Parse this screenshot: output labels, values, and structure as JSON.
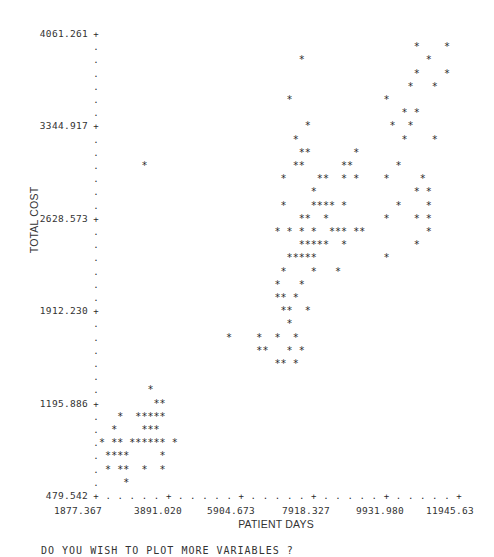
{
  "chart_data": {
    "type": "scatter",
    "style": "line-printer character plot",
    "title": "",
    "xlabel": "PATIENT DAYS",
    "ylabel": "TOTAL COST",
    "xlim": [
      1877.367,
      11945.63
    ],
    "ylim": [
      479.542,
      4061.261
    ],
    "x_ticks": [
      "1877.367",
      "3891.020",
      "5904.673",
      "7918.327",
      "9931.980",
      "11945.63"
    ],
    "y_ticks": [
      "4061.261",
      "3344.917",
      "2628.573",
      "1912.230",
      "1195.886",
      "479.542"
    ],
    "grid": false,
    "marker": "*",
    "grid_cols": 61,
    "grid_rows": 36,
    "points_rowcol": [
      [
        2,
        34
      ],
      [
        5,
        32
      ],
      [
        7,
        35
      ],
      [
        8,
        33
      ],
      [
        9,
        34
      ],
      [
        9,
        35
      ],
      [
        9,
        43
      ],
      [
        10,
        8
      ],
      [
        10,
        33
      ],
      [
        10,
        34
      ],
      [
        10,
        41
      ],
      [
        10,
        42
      ],
      [
        11,
        31
      ],
      [
        11,
        37
      ],
      [
        11,
        38
      ],
      [
        11,
        41
      ],
      [
        11,
        43
      ],
      [
        12,
        36
      ],
      [
        13,
        31
      ],
      [
        13,
        36
      ],
      [
        13,
        37
      ],
      [
        13,
        38
      ],
      [
        13,
        39
      ],
      [
        13,
        41
      ],
      [
        14,
        34
      ],
      [
        14,
        35
      ],
      [
        14,
        38
      ],
      [
        15,
        30
      ],
      [
        15,
        32
      ],
      [
        15,
        34
      ],
      [
        15,
        36
      ],
      [
        15,
        39
      ],
      [
        15,
        40
      ],
      [
        15,
        41
      ],
      [
        15,
        43
      ],
      [
        15,
        44
      ],
      [
        16,
        34
      ],
      [
        16,
        35
      ],
      [
        16,
        36
      ],
      [
        16,
        37
      ],
      [
        16,
        38
      ],
      [
        16,
        41
      ],
      [
        17,
        32
      ],
      [
        17,
        33
      ],
      [
        17,
        34
      ],
      [
        17,
        35
      ],
      [
        17,
        36
      ],
      [
        18,
        31
      ],
      [
        18,
        36
      ],
      [
        18,
        40
      ],
      [
        19,
        30
      ],
      [
        19,
        34
      ],
      [
        20,
        30
      ],
      [
        20,
        31
      ],
      [
        20,
        33
      ],
      [
        21,
        31
      ],
      [
        21,
        32
      ],
      [
        21,
        35
      ],
      [
        22,
        32
      ],
      [
        23,
        22
      ],
      [
        23,
        27
      ],
      [
        23,
        30
      ],
      [
        23,
        33
      ],
      [
        24,
        27
      ],
      [
        24,
        28
      ],
      [
        24,
        32
      ],
      [
        24,
        34
      ],
      [
        25,
        30
      ],
      [
        25,
        31
      ],
      [
        25,
        33
      ],
      [
        1,
        53
      ],
      [
        1,
        58
      ],
      [
        2,
        55
      ],
      [
        3,
        53
      ],
      [
        3,
        58
      ],
      [
        4,
        52
      ],
      [
        4,
        56
      ],
      [
        5,
        48
      ],
      [
        6,
        51
      ],
      [
        6,
        53
      ],
      [
        7,
        49
      ],
      [
        7,
        52
      ],
      [
        8,
        51
      ],
      [
        8,
        56
      ],
      [
        10,
        50
      ],
      [
        11,
        48
      ],
      [
        11,
        54
      ],
      [
        12,
        53
      ],
      [
        12,
        55
      ],
      [
        13,
        50
      ],
      [
        13,
        55
      ],
      [
        14,
        48
      ],
      [
        14,
        53
      ],
      [
        14,
        55
      ],
      [
        15,
        55
      ],
      [
        16,
        53
      ],
      [
        17,
        48
      ],
      [
        27,
        9
      ],
      [
        28,
        10
      ],
      [
        28,
        11
      ],
      [
        29,
        4
      ],
      [
        29,
        7
      ],
      [
        29,
        8
      ],
      [
        29,
        9
      ],
      [
        29,
        10
      ],
      [
        29,
        11
      ],
      [
        30,
        3
      ],
      [
        30,
        8
      ],
      [
        30,
        9
      ],
      [
        30,
        10
      ],
      [
        31,
        1
      ],
      [
        31,
        3
      ],
      [
        31,
        4
      ],
      [
        31,
        6
      ],
      [
        31,
        7
      ],
      [
        31,
        8
      ],
      [
        31,
        9
      ],
      [
        31,
        10
      ],
      [
        31,
        11
      ],
      [
        31,
        13
      ],
      [
        32,
        2
      ],
      [
        32,
        3
      ],
      [
        32,
        4
      ],
      [
        32,
        5
      ],
      [
        32,
        11
      ],
      [
        33,
        2
      ],
      [
        33,
        4
      ],
      [
        33,
        5
      ],
      [
        33,
        8
      ],
      [
        33,
        11
      ],
      [
        34,
        5
      ]
    ]
  },
  "axes": {
    "y_title": "TOTAL COST",
    "x_title": "PATIENT DAYS",
    "y_tick_labels": [
      "4061.261",
      "3344.917",
      "2628.573",
      "1912.230",
      "1195.886",
      "479.542"
    ],
    "x_tick_labels": [
      "1877.367",
      "3891.020",
      "5904.673",
      "7918.327",
      "9931.980",
      "11945.63"
    ]
  },
  "console": {
    "prompt": "DO YOU WISH TO PLOT MORE VARIABLES ?"
  }
}
